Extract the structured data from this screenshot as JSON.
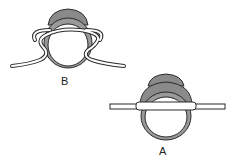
{
  "figure": {
    "panels": [
      {
        "id": "B",
        "label": "B",
        "caption": "cord wrapped around ring with loops on both sides"
      },
      {
        "id": "A",
        "label": "A",
        "caption": "cord passing straight through ring"
      }
    ],
    "colors": {
      "stroke": "#2a2a2a",
      "bezel": "#8a8a8a",
      "cord_fill": "#ffffff",
      "background": "#ffffff"
    }
  }
}
